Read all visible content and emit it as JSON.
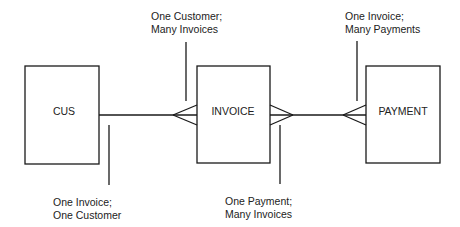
{
  "diagram": {
    "type": "entity-relationship",
    "entities": [
      {
        "id": "cus",
        "label": "CUS"
      },
      {
        "id": "invoice",
        "label": "INVOICE"
      },
      {
        "id": "payment",
        "label": "PAYMENT"
      }
    ],
    "relationships": [
      {
        "from": "cus",
        "to": "invoice",
        "from_cardinality": "one",
        "to_cardinality": "many"
      },
      {
        "from": "invoice",
        "to": "payment",
        "from_cardinality": "many",
        "to_cardinality": "many"
      }
    ],
    "annotations": [
      {
        "id": "cus-invoice-top",
        "line1": "One Customer;",
        "line2": "Many Invoices"
      },
      {
        "id": "cus-invoice-bottom",
        "line1": "One Invoice;",
        "line2": "One Customer"
      },
      {
        "id": "invoice-payment-bottom",
        "line1": "One Payment;",
        "line2": "Many Invoices"
      },
      {
        "id": "invoice-payment-top",
        "line1": "One Invoice;",
        "line2": "Many Payments"
      }
    ],
    "colors": {
      "stroke": "#1a1a1a",
      "background": "#ffffff"
    }
  }
}
